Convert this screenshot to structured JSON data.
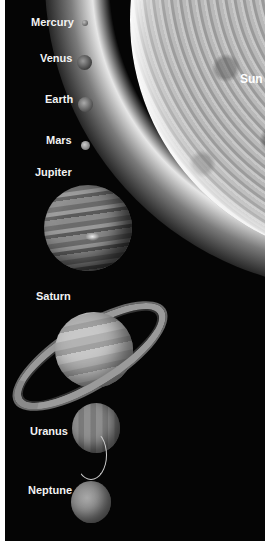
{
  "sun": {
    "label": "Sun"
  },
  "planets": [
    {
      "name": "Mercury"
    },
    {
      "name": "Venus"
    },
    {
      "name": "Earth"
    },
    {
      "name": "Mars"
    },
    {
      "name": "Jupiter"
    },
    {
      "name": "Saturn"
    },
    {
      "name": "Uranus"
    },
    {
      "name": "Neptune"
    }
  ],
  "colors": {
    "background": "#050505",
    "border": "#ffffff",
    "label": "#f2f2f2"
  }
}
